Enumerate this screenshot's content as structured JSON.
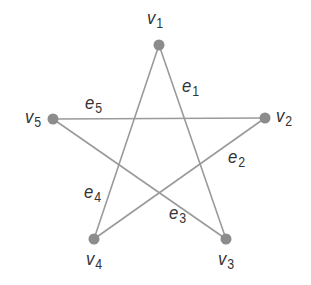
{
  "diagram": {
    "type": "graph",
    "colors": {
      "edge": "#9a9a9a",
      "vertex": "#8c8c8c",
      "label": "#333333",
      "background": "#ffffff"
    },
    "vertices": [
      {
        "id": "v1",
        "label": "v",
        "sub": "1",
        "x": 159,
        "y": 45,
        "lx": 147,
        "ly": 8
      },
      {
        "id": "v2",
        "label": "v",
        "sub": "2",
        "x": 265,
        "y": 118,
        "lx": 276,
        "ly": 106
      },
      {
        "id": "v3",
        "label": "v",
        "sub": "3",
        "x": 226,
        "y": 239,
        "lx": 218,
        "ly": 249
      },
      {
        "id": "v4",
        "label": "v",
        "sub": "4",
        "x": 94,
        "y": 239,
        "lx": 86,
        "ly": 249
      },
      {
        "id": "v5",
        "label": "v",
        "sub": "5",
        "x": 53,
        "y": 119,
        "lx": 25,
        "ly": 107
      }
    ],
    "edges": [
      {
        "id": "e1",
        "label": "e",
        "sub": "1",
        "from": "v1",
        "to": "v3",
        "lx": 182,
        "ly": 76
      },
      {
        "id": "e2",
        "label": "e",
        "sub": "2",
        "from": "v2",
        "to": "v4",
        "lx": 228,
        "ly": 147
      },
      {
        "id": "e3",
        "label": "e",
        "sub": "3",
        "from": "v3",
        "to": "v5",
        "lx": 169,
        "ly": 203
      },
      {
        "id": "e4",
        "label": "e",
        "sub": "4",
        "from": "v4",
        "to": "v1",
        "lx": 84,
        "ly": 182
      },
      {
        "id": "e5",
        "label": "e",
        "sub": "5",
        "from": "v5",
        "to": "v2",
        "lx": 85,
        "ly": 93
      }
    ]
  }
}
